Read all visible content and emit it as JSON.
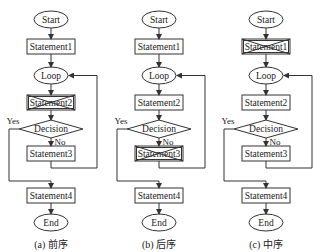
{
  "panels": [
    {
      "caption": "(a) 前序",
      "center_x": 51,
      "nodes": {
        "start": "Start",
        "s1": "Statement1",
        "loop": "Loop",
        "s2": "Statement2",
        "decision": "Decision",
        "s3": "Statement3",
        "s4": "Statement4",
        "end": "End"
      },
      "crossed_out": "s2",
      "yes_label": "Yes",
      "no_label": "No"
    },
    {
      "caption": "(b) 后序",
      "center_x": 159,
      "nodes": {
        "start": "Start",
        "s1": "Statement1",
        "loop": "Loop",
        "s2": "Statement2",
        "decision": "Decision",
        "s3": "Statement3",
        "s4": "Statement4",
        "end": "End"
      },
      "crossed_out": "s3",
      "yes_label": "Yes",
      "no_label": "No"
    },
    {
      "caption": "(c) 中序",
      "center_x": 266,
      "nodes": {
        "start": "Start",
        "s1": "Statement1",
        "loop": "Loop",
        "s2": "Statement2",
        "decision": "Decision",
        "s3": "Statement3",
        "s4": "Statement4",
        "end": "End"
      },
      "crossed_out": "s1",
      "yes_label": "Yes",
      "no_label": "No"
    }
  ],
  "colors": {
    "stroke": "#333333",
    "text": "#222222",
    "background": "#ffffff"
  }
}
